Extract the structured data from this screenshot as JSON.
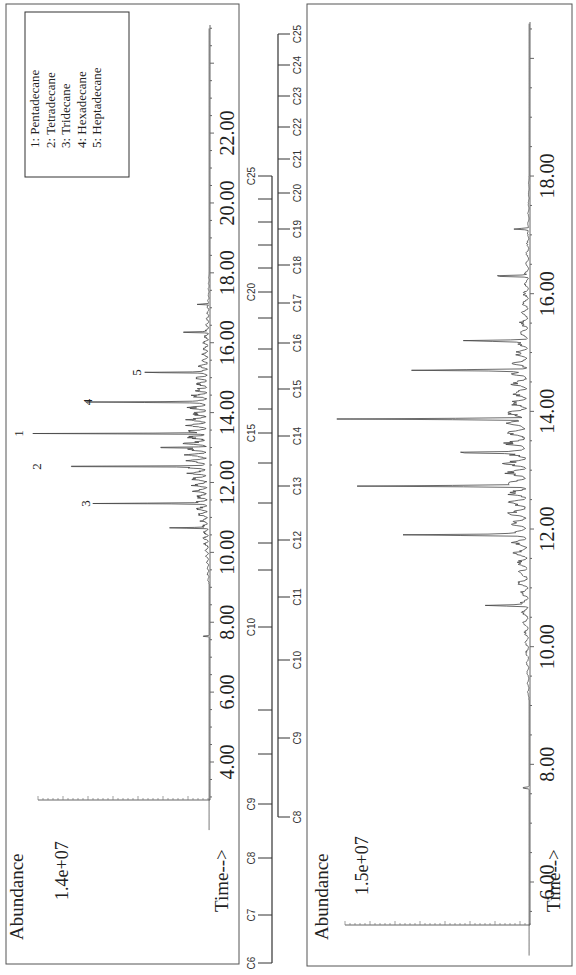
{
  "chart_data": [
    {
      "type": "line",
      "panel": "top",
      "title": "",
      "xlabel": "Time-->",
      "ylabel": "Abundance",
      "y_scale_label": "1.4e+07",
      "x_ticks": [
        "4.00",
        "6.00",
        "8.00",
        "10.00",
        "12.00",
        "14.00",
        "16.00",
        "18.00",
        "20.00",
        "22.00"
      ],
      "xlim": [
        2.0,
        25.0
      ],
      "ylim": [
        0,
        14000000
      ],
      "legend": {
        "position": "upper-right-in-rotated-frame",
        "entries": [
          "1:  Pentadecane",
          "2:  Tetradecane",
          "3:  Tridecane",
          "4:  Hexadecane",
          "5:  Heptadecane"
        ]
      },
      "annotations": [
        {
          "label": "1",
          "time": 13.4
        },
        {
          "label": "2",
          "time": 12.46
        },
        {
          "label": "3",
          "time": 11.4
        },
        {
          "label": "4",
          "time": 14.3
        },
        {
          "label": "5",
          "time": 15.15
        }
      ],
      "peaks": [
        {
          "time": 7.6,
          "abundance": 500000
        },
        {
          "time": 10.7,
          "abundance": 2500000
        },
        {
          "time": 11.4,
          "abundance": 7200000,
          "label": "3"
        },
        {
          "time": 12.46,
          "abundance": 10500000,
          "label": "2"
        },
        {
          "time": 13.0,
          "abundance": 3500000
        },
        {
          "time": 13.4,
          "abundance": 11700000,
          "label": "1"
        },
        {
          "time": 14.3,
          "abundance": 7100000,
          "label": "4"
        },
        {
          "time": 15.15,
          "abundance": 3800000,
          "label": "5"
        },
        {
          "time": 16.3,
          "abundance": 2000000
        },
        {
          "time": 17.1,
          "abundance": 800000
        }
      ],
      "grid": false
    },
    {
      "type": "line",
      "panel": "bottom",
      "title": "",
      "xlabel": "Time-->",
      "ylabel": "Abundance",
      "y_scale_label": "1.5e+07",
      "x_ticks": [
        "6.00",
        "8.00",
        "10.00",
        "12.00",
        "14.00",
        "16.00",
        "18.00"
      ],
      "xlim": [
        4.7,
        20.6
      ],
      "ylim": [
        0,
        15000000
      ],
      "peaks": [
        {
          "time": 7.6,
          "abundance": 500000
        },
        {
          "time": 10.7,
          "abundance": 2600000
        },
        {
          "time": 11.9,
          "abundance": 7800000
        },
        {
          "time": 12.73,
          "abundance": 10800000
        },
        {
          "time": 13.3,
          "abundance": 3900000
        },
        {
          "time": 13.87,
          "abundance": 12300000
        },
        {
          "time": 14.7,
          "abundance": 7600000
        },
        {
          "time": 15.2,
          "abundance": 4000000
        },
        {
          "time": 16.3,
          "abundance": 2400000
        },
        {
          "time": 17.1,
          "abundance": 1000000
        }
      ],
      "grid": false
    }
  ],
  "scales": {
    "upper_scale": {
      "labels": [
        "C6",
        "C7",
        "C8",
        "C9",
        "C10",
        "C15",
        "C20",
        "C25"
      ],
      "positions_px": [
        {
          "label": "C6",
          "y": 963
        },
        {
          "label": "C7",
          "y": 915
        },
        {
          "label": "C8",
          "y": 858
        },
        {
          "label": "C9",
          "y": 804
        },
        {
          "label": "C10",
          "y": 627
        },
        {
          "label": "C15",
          "y": 433
        },
        {
          "label": "C20",
          "y": 292
        },
        {
          "label": "C25",
          "y": 176
        }
      ],
      "ticks_y": [
        963,
        915,
        858,
        804,
        754,
        710,
        627,
        570,
        543,
        503,
        463,
        433,
        409,
        377,
        349,
        318,
        292,
        268,
        245,
        222,
        199,
        176
      ]
    },
    "lower_scale": {
      "labels": [
        "C8",
        "C9",
        "C10",
        "C11",
        "C12",
        "C13",
        "C14",
        "C15",
        "C16",
        "C17",
        "C18",
        "C19",
        "C20",
        "C21",
        "C22",
        "C23",
        "C24",
        "C25"
      ],
      "positions_px": [
        {
          "label": "C8",
          "y": 817
        },
        {
          "label": "C9",
          "y": 738
        },
        {
          "label": "C10",
          "y": 660
        },
        {
          "label": "C11",
          "y": 597
        },
        {
          "label": "C12",
          "y": 540
        },
        {
          "label": "C13",
          "y": 486
        },
        {
          "label": "C14",
          "y": 436
        },
        {
          "label": "C15",
          "y": 389
        },
        {
          "label": "C16",
          "y": 343
        },
        {
          "label": "C17",
          "y": 303
        },
        {
          "label": "C18",
          "y": 265
        },
        {
          "label": "C19",
          "y": 229
        },
        {
          "label": "C20",
          "y": 193
        },
        {
          "label": "C21",
          "y": 159
        },
        {
          "label": "C22",
          "y": 127
        },
        {
          "label": "C23",
          "y": 96
        },
        {
          "label": "C24",
          "y": 65
        },
        {
          "label": "C25",
          "y": 34
        }
      ]
    }
  },
  "colors": {
    "ink": "#222222",
    "trace": "#444444",
    "frame": "#555555"
  }
}
